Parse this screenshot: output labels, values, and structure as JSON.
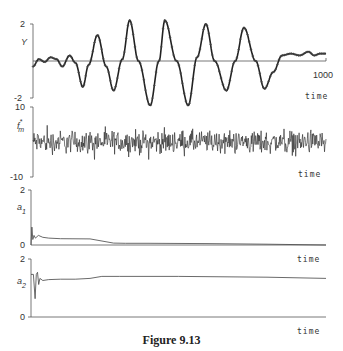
{
  "caption": "Figure 9.13",
  "chart_data": [
    {
      "type": "line",
      "panel": "top",
      "ylabel": "Y",
      "xlabel": "time",
      "ylim": [
        -2,
        2
      ],
      "yticks": [
        "2",
        "-2"
      ],
      "xtick_end": "1000",
      "xlim": [
        0,
        1000
      ],
      "description": "Actual output (line) with model output (cross markers) overlaid; oscillation grows then decays",
      "x": [
        0,
        20,
        40,
        60,
        80,
        100,
        125,
        145,
        170,
        190,
        220,
        250,
        275,
        305,
        330,
        360,
        400,
        430,
        450,
        490,
        530,
        560,
        590,
        620,
        660,
        690,
        720,
        760,
        790,
        820,
        850,
        880,
        910,
        940,
        960,
        980,
        1000
      ],
      "values": [
        -0.3,
        0.1,
        -0.05,
        0.2,
        0.1,
        -0.3,
        0.3,
        -0.1,
        -1.4,
        -0.2,
        1.4,
        -0.3,
        -1.6,
        0.1,
        2.2,
        0.0,
        -2.4,
        0.0,
        2.2,
        0.0,
        -2.4,
        0.2,
        2.0,
        0.0,
        -1.6,
        0.0,
        1.8,
        0.0,
        -1.5,
        -0.6,
        0.3,
        0.4,
        0.3,
        0.5,
        0.3,
        0.4,
        0.4
      ]
    },
    {
      "type": "line",
      "panel": "noise",
      "ylabel": "f*m",
      "xlabel": "time",
      "ylim": [
        -10,
        10
      ],
      "yticks": [
        "10",
        "-10"
      ],
      "description": "Random noise signal fluctuating roughly between -4 and +5 around zero"
    },
    {
      "type": "line",
      "panel": "a1",
      "ylabel": "a1",
      "xlabel": "time",
      "ylim": [
        0,
        2
      ],
      "yticks": [
        "2",
        "1",
        "0"
      ],
      "x": [
        0,
        3,
        6,
        10,
        15,
        25,
        40,
        60,
        100,
        200,
        280,
        320,
        400,
        600,
        800,
        1000
      ],
      "values": [
        0.0,
        0.65,
        0.2,
        0.35,
        0.25,
        0.35,
        0.28,
        0.25,
        0.23,
        0.22,
        0.07,
        0.06,
        0.06,
        0.05,
        0.03,
        0.0
      ]
    },
    {
      "type": "line",
      "panel": "a2",
      "ylabel": "a2",
      "xlabel": "time",
      "ylim": [
        0,
        2
      ],
      "yticks": [
        "2",
        "0"
      ],
      "x": [
        0,
        8,
        14,
        18,
        22,
        26,
        30,
        40,
        60,
        100,
        150,
        200,
        240,
        300,
        500,
        800,
        1000
      ],
      "values": [
        1.05,
        1.05,
        0.45,
        1.05,
        1.1,
        0.8,
        0.95,
        0.9,
        0.92,
        0.93,
        0.93,
        0.95,
        1.0,
        1.0,
        1.0,
        0.98,
        0.95
      ]
    }
  ],
  "panels": {
    "top": {
      "ytick_top": "2",
      "ytick_bottom": "-2",
      "ylabel": "Y",
      "x_end": "1000",
      "xlabel": "time"
    },
    "noise": {
      "ytick_top": "10",
      "ytick_bottom": "-10",
      "ylabel": "f",
      "ylabel_sup": "*",
      "ylabel_sub": "m",
      "xlabel": "time"
    },
    "a1": {
      "ytick_top": "2",
      "ytick_mid": "1",
      "ytick_bottom": "0",
      "ylabel": "a",
      "ylabel_sub": "1",
      "xlabel": "time"
    },
    "a2": {
      "ytick_top": "2",
      "ytick_bottom": "0",
      "ylabel": "a",
      "ylabel_sub": "2",
      "xlabel": "time"
    }
  }
}
